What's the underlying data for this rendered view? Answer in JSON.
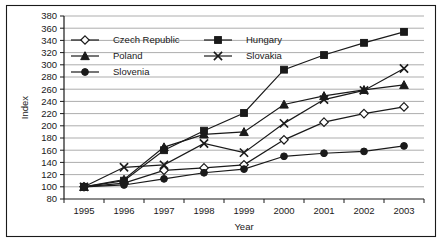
{
  "chart_data": {
    "type": "line",
    "title": "",
    "xlabel": "Year",
    "ylabel": "Index",
    "categories": [
      "1995",
      "1996",
      "1997",
      "1998",
      "1999",
      "2000",
      "2001",
      "2002",
      "2003"
    ],
    "x": [
      1995,
      1996,
      1997,
      1998,
      1999,
      2000,
      2001,
      2002,
      2003
    ],
    "ylim": [
      80,
      380
    ],
    "ytick_step": 20,
    "yticks": [
      80,
      100,
      120,
      140,
      160,
      180,
      200,
      220,
      240,
      260,
      280,
      300,
      320,
      340,
      360,
      380
    ],
    "grid": true,
    "legend_position": "upper-left-inside",
    "series": [
      {
        "name": "Czech Republic",
        "marker": "open-diamond",
        "values": [
          100,
          106,
          127,
          131,
          136,
          177,
          206,
          220,
          231
        ]
      },
      {
        "name": "Hungary",
        "marker": "filled-square",
        "values": [
          100,
          110,
          160,
          192,
          221,
          292,
          316,
          336,
          354
        ]
      },
      {
        "name": "Poland",
        "marker": "filled-triangle",
        "values": [
          100,
          112,
          165,
          186,
          190,
          235,
          249,
          259,
          267
        ]
      },
      {
        "name": "Slovakia",
        "marker": "cross-x",
        "values": [
          100,
          132,
          136,
          171,
          156,
          204,
          243,
          258,
          294
        ]
      },
      {
        "name": "Slovenia",
        "marker": "filled-circle",
        "values": [
          100,
          103,
          113,
          123,
          129,
          150,
          155,
          158,
          167
        ]
      }
    ]
  },
  "legend": {
    "entries": [
      {
        "label": "Czech Republic",
        "marker": "open-diamond"
      },
      {
        "label": "Hungary",
        "marker": "filled-square"
      },
      {
        "label": "Poland",
        "marker": "filled-triangle"
      },
      {
        "label": "Slovakia",
        "marker": "cross-x"
      },
      {
        "label": "Slovenia",
        "marker": "filled-circle"
      }
    ]
  },
  "colors": {
    "ink": "#1a1a1a",
    "grid": "#8a8a8a",
    "background": "#ffffff"
  }
}
